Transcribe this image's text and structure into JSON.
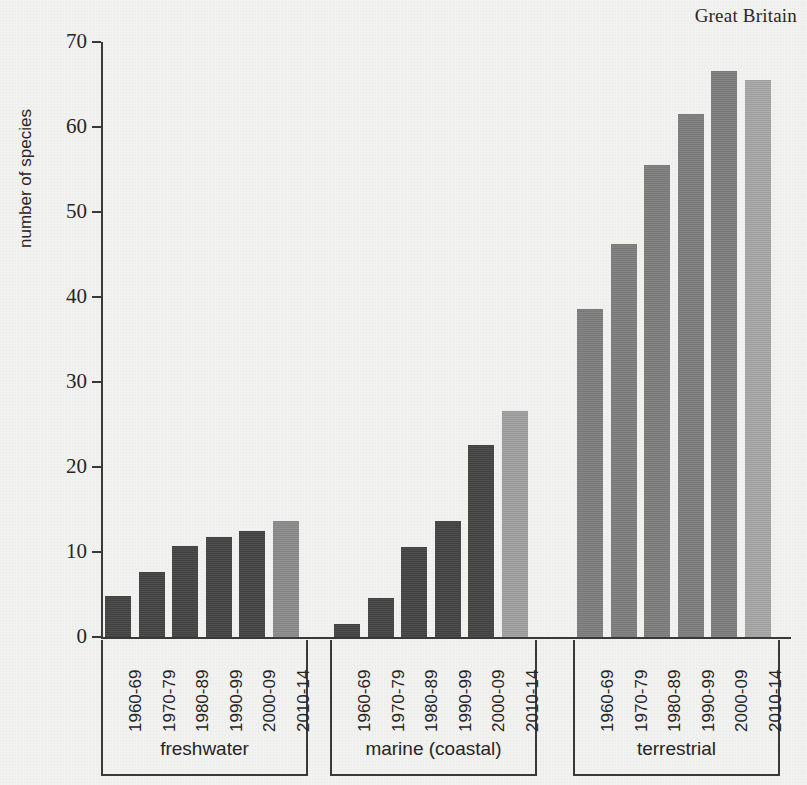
{
  "caption": "Great Britain",
  "axes": {
    "y_label": "number of species",
    "y_ticks": [
      "0",
      "10",
      "20",
      "30",
      "40",
      "50",
      "60",
      "70"
    ]
  },
  "colors": {
    "background": "#f2f2f0",
    "axis": "#3b3838",
    "text": "#272525",
    "freshwater_dark": "#444444",
    "freshwater_light": "#8c8c8c",
    "marine_dark": "#444444",
    "marine_light": "#a0a0a0",
    "terrestrial_dark": "#7e7e7e",
    "terrestrial_light": "#a8a8a8"
  },
  "chart_data": {
    "type": "bar",
    "title": "Great Britain",
    "xlabel": "",
    "ylabel": "number of species",
    "ylim": [
      0,
      70
    ],
    "yticks": [
      0,
      10,
      20,
      30,
      40,
      50,
      60,
      70
    ],
    "grid": false,
    "legend": "none",
    "categories": [
      "1960-69",
      "1970-79",
      "1980-89",
      "1990-99",
      "2000-09",
      "2010-14"
    ],
    "groups": [
      {
        "name": "freshwater",
        "values": [
          5.0,
          7.8,
          10.8,
          11.9,
          12.6,
          13.8
        ],
        "bar_colors": [
          "#444444",
          "#444444",
          "#444444",
          "#444444",
          "#444444",
          "#8c8c8c"
        ]
      },
      {
        "name": "marine (coastal)",
        "values": [
          1.7,
          4.7,
          10.7,
          13.8,
          22.7,
          26.7
        ],
        "bar_colors": [
          "#444444",
          "#444444",
          "#444444",
          "#444444",
          "#444444",
          "#a0a0a0"
        ]
      },
      {
        "name": "terrestrial",
        "values": [
          38.7,
          46.4,
          55.6,
          61.7,
          66.7,
          65.6
        ],
        "bar_colors": [
          "#7e7e7e",
          "#7e7e7e",
          "#7e7e7e",
          "#7e7e7e",
          "#7e7e7e",
          "#a8a8a8"
        ]
      }
    ]
  }
}
